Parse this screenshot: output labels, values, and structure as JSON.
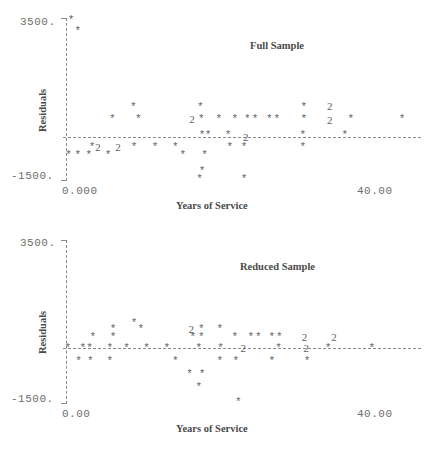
{
  "figure": {
    "xlabel": "Years of Service",
    "ylabel": "Residuals",
    "marker_glyph": "*",
    "overplot_glyph": "2",
    "axis_color": "#8a8a8a",
    "marker_color": "#5f5f5f",
    "text_color": "#4a4a4a"
  },
  "chart_data": [
    {
      "type": "scatter",
      "title": "Full Sample",
      "xlabel": "Years of Service",
      "ylabel": "Residuals",
      "xlim": [
        0.0,
        40.0
      ],
      "ylim": [
        -1500,
        3500
      ],
      "xticks": [
        "0.000",
        "40.00"
      ],
      "yticks": [
        "3500.",
        "-1500."
      ],
      "grid": false,
      "legend": "none",
      "reference_line_y": 0,
      "points": [
        {
          "x": 0.6,
          "y": 3450,
          "glyph": "*"
        },
        {
          "x": 1.4,
          "y": 3130,
          "glyph": "*"
        },
        {
          "x": 8.0,
          "y": 880,
          "glyph": "*"
        },
        {
          "x": 5.5,
          "y": 520,
          "glyph": "*"
        },
        {
          "x": 8.6,
          "y": 520,
          "glyph": "*"
        },
        {
          "x": 16.0,
          "y": 880,
          "glyph": "*"
        },
        {
          "x": 15.0,
          "y": 520,
          "glyph": "2"
        },
        {
          "x": 16.1,
          "y": 520,
          "glyph": "*"
        },
        {
          "x": 18.2,
          "y": 520,
          "glyph": "*"
        },
        {
          "x": 20.1,
          "y": 520,
          "glyph": "*"
        },
        {
          "x": 21.6,
          "y": 520,
          "glyph": "*"
        },
        {
          "x": 22.5,
          "y": 520,
          "glyph": "*"
        },
        {
          "x": 24.2,
          "y": 520,
          "glyph": "*"
        },
        {
          "x": 25.1,
          "y": 520,
          "glyph": "*"
        },
        {
          "x": 28.3,
          "y": 880,
          "glyph": "*"
        },
        {
          "x": 28.3,
          "y": 520,
          "glyph": "*"
        },
        {
          "x": 31.4,
          "y": 900,
          "glyph": "2"
        },
        {
          "x": 31.4,
          "y": 500,
          "glyph": "2"
        },
        {
          "x": 33.9,
          "y": 520,
          "glyph": "*"
        },
        {
          "x": 40.0,
          "y": 520,
          "glyph": "*"
        },
        {
          "x": 16.2,
          "y": 50,
          "glyph": "*"
        },
        {
          "x": 16.9,
          "y": 50,
          "glyph": "*"
        },
        {
          "x": 19.3,
          "y": 50,
          "glyph": "*"
        },
        {
          "x": 21.4,
          "y": 0,
          "glyph": "2"
        },
        {
          "x": 28.2,
          "y": 50,
          "glyph": "*"
        },
        {
          "x": 33.2,
          "y": 50,
          "glyph": "*"
        },
        {
          "x": 3.1,
          "y": -330,
          "glyph": "*"
        },
        {
          "x": 3.8,
          "y": -330,
          "glyph": "2"
        },
        {
          "x": 6.2,
          "y": -330,
          "glyph": "2"
        },
        {
          "x": 8.1,
          "y": -330,
          "glyph": "*"
        },
        {
          "x": 10.6,
          "y": -330,
          "glyph": "*"
        },
        {
          "x": 13.0,
          "y": -330,
          "glyph": "*"
        },
        {
          "x": 19.5,
          "y": -330,
          "glyph": "*"
        },
        {
          "x": 21.2,
          "y": -330,
          "glyph": "*"
        },
        {
          "x": 28.2,
          "y": -330,
          "glyph": "*"
        },
        {
          "x": 0.3,
          "y": -620,
          "glyph": "*"
        },
        {
          "x": 1.4,
          "y": -620,
          "glyph": "*"
        },
        {
          "x": 2.7,
          "y": -620,
          "glyph": "*"
        },
        {
          "x": 5.0,
          "y": -620,
          "glyph": "*"
        },
        {
          "x": 13.9,
          "y": -620,
          "glyph": "*"
        },
        {
          "x": 16.5,
          "y": -620,
          "glyph": "*"
        },
        {
          "x": 16.2,
          "y": -1180,
          "glyph": "*"
        },
        {
          "x": 15.9,
          "y": -1480,
          "glyph": "*"
        },
        {
          "x": 21.2,
          "y": -1480,
          "glyph": "*"
        }
      ]
    },
    {
      "type": "scatter",
      "title": "Reduced Sample",
      "xlabel": "Years of Service",
      "ylabel": "Residuals",
      "xlim": [
        0.0,
        40.0
      ],
      "ylim": [
        -1500,
        3500
      ],
      "xticks": [
        "0.00",
        "40.00"
      ],
      "yticks": [
        "3500.",
        "-1500."
      ],
      "grid": false,
      "legend": "none",
      "reference_line_y": 0,
      "points": [
        {
          "x": 8.1,
          "y": 820,
          "glyph": "*"
        },
        {
          "x": 5.6,
          "y": 620,
          "glyph": "*"
        },
        {
          "x": 8.9,
          "y": 620,
          "glyph": "*"
        },
        {
          "x": 14.9,
          "y": 620,
          "glyph": "2"
        },
        {
          "x": 16.1,
          "y": 620,
          "glyph": "*"
        },
        {
          "x": 18.3,
          "y": 620,
          "glyph": "*"
        },
        {
          "x": 3.2,
          "y": 360,
          "glyph": "*"
        },
        {
          "x": 5.6,
          "y": 360,
          "glyph": "*"
        },
        {
          "x": 15.1,
          "y": 360,
          "glyph": "*"
        },
        {
          "x": 16.1,
          "y": 360,
          "glyph": "*"
        },
        {
          "x": 20.1,
          "y": 360,
          "glyph": "*"
        },
        {
          "x": 22.0,
          "y": 360,
          "glyph": "*"
        },
        {
          "x": 22.9,
          "y": 360,
          "glyph": "*"
        },
        {
          "x": 24.5,
          "y": 360,
          "glyph": "*"
        },
        {
          "x": 25.4,
          "y": 360,
          "glyph": "*"
        },
        {
          "x": 28.4,
          "y": 360,
          "glyph": "2"
        },
        {
          "x": 31.9,
          "y": 360,
          "glyph": "2"
        },
        {
          "x": 0.2,
          "y": 0,
          "glyph": "*"
        },
        {
          "x": 2.0,
          "y": 0,
          "glyph": "*"
        },
        {
          "x": 2.8,
          "y": 0,
          "glyph": "*"
        },
        {
          "x": 5.2,
          "y": 0,
          "glyph": "*"
        },
        {
          "x": 7.2,
          "y": 0,
          "glyph": "*"
        },
        {
          "x": 9.6,
          "y": 0,
          "glyph": "*"
        },
        {
          "x": 12.0,
          "y": 0,
          "glyph": "*"
        },
        {
          "x": 15.8,
          "y": 0,
          "glyph": "*"
        },
        {
          "x": 18.4,
          "y": 0,
          "glyph": "*"
        },
        {
          "x": 21.1,
          "y": 0,
          "glyph": "2"
        },
        {
          "x": 25.3,
          "y": 0,
          "glyph": "*"
        },
        {
          "x": 28.6,
          "y": 0,
          "glyph": "2"
        },
        {
          "x": 31.2,
          "y": 0,
          "glyph": "*"
        },
        {
          "x": 36.4,
          "y": 0,
          "glyph": "*"
        },
        {
          "x": 1.5,
          "y": -340,
          "glyph": "*"
        },
        {
          "x": 2.9,
          "y": -340,
          "glyph": "*"
        },
        {
          "x": 5.2,
          "y": -340,
          "glyph": "*"
        },
        {
          "x": 13.0,
          "y": -340,
          "glyph": "*"
        },
        {
          "x": 18.3,
          "y": -340,
          "glyph": "*"
        },
        {
          "x": 20.2,
          "y": -340,
          "glyph": "*"
        },
        {
          "x": 24.5,
          "y": -340,
          "glyph": "*"
        },
        {
          "x": 28.7,
          "y": -340,
          "glyph": "*"
        },
        {
          "x": 14.7,
          "y": -700,
          "glyph": "*"
        },
        {
          "x": 16.2,
          "y": -700,
          "glyph": "*"
        },
        {
          "x": 15.8,
          "y": -1050,
          "glyph": "*"
        },
        {
          "x": 20.5,
          "y": -1480,
          "glyph": "*"
        }
      ]
    }
  ]
}
